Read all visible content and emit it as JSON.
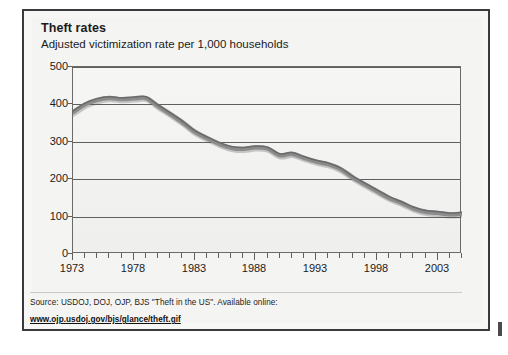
{
  "figure": {
    "title": "Theft rates",
    "subtitle": "Adjusted victimization rate per 1,000 households",
    "source_text": "Source: USDOJ, DOJ, OJP, BJS \"Theft in the US\". Available online:",
    "source_url": "www.ojp.usdoj.gov/bjs/glance/theft.gif",
    "line_color": "#8c8c8c",
    "line_shadow_color": "#5a5a5a",
    "grid_color": "#5f5f5f",
    "plot_background": "#f3f3f1",
    "frame_color": "#3a3a3c"
  },
  "chart_data": {
    "type": "line",
    "title": "Theft rates",
    "subtitle": "Adjusted victimization rate per 1,000 households",
    "xlabel": "",
    "ylabel": "Adjusted victimization rate per 1,000 households",
    "ylim": [
      0,
      500
    ],
    "xlim": [
      1973,
      2005
    ],
    "yticks": [
      0,
      100,
      200,
      300,
      400,
      500
    ],
    "ytick_labels": [
      "0",
      "100",
      "200",
      "300",
      "400",
      "500"
    ],
    "xticks": [
      1973,
      1978,
      1983,
      1988,
      1993,
      1998,
      2003
    ],
    "xtick_labels": [
      "1973",
      "1978",
      "1983",
      "1988",
      "1993",
      "1998",
      "2003"
    ],
    "minor_xticks_every": 1,
    "grid": true,
    "grid_axis": "y",
    "legend": false,
    "series": [
      {
        "name": "Theft rate per 1,000 households",
        "x": [
          1973,
          1974,
          1975,
          1976,
          1977,
          1978,
          1979,
          1980,
          1981,
          1982,
          1983,
          1984,
          1985,
          1986,
          1987,
          1988,
          1989,
          1990,
          1991,
          1992,
          1993,
          1994,
          1995,
          1996,
          1997,
          1998,
          1999,
          2000,
          2001,
          2002,
          2003,
          2004,
          2005
        ],
        "values": [
          379,
          400,
          412,
          417,
          414,
          416,
          417,
          395,
          374,
          352,
          327,
          310,
          295,
          284,
          281,
          285,
          282,
          264,
          268,
          257,
          247,
          240,
          227,
          205,
          186,
          168,
          150,
          137,
          122,
          113,
          110,
          106,
          108
        ]
      }
    ]
  }
}
